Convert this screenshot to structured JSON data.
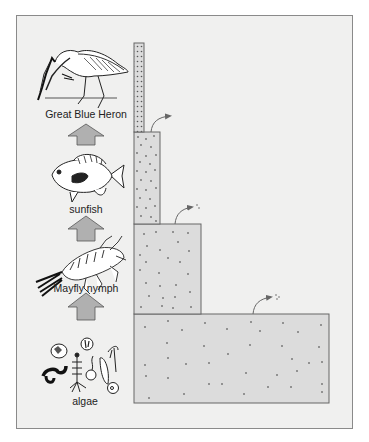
{
  "diagram": {
    "type": "energy pyramid / food chain",
    "organisms": [
      {
        "level": 4,
        "name": "Great Blue Heron",
        "icon": "heron-icon"
      },
      {
        "level": 3,
        "name": "sunfish",
        "icon": "fish-icon"
      },
      {
        "level": 2,
        "name": "Mayfly nymph",
        "icon": "mayfly-nymph-icon"
      },
      {
        "level": 1,
        "name": "algae",
        "icon": "algae-icon"
      }
    ],
    "arrows": [
      "up-arrow",
      "up-arrow",
      "up-arrow"
    ],
    "colors": {
      "background": "#f0f0ef",
      "bar_fill": "#dcdcdc",
      "bar_border": "#666666",
      "arrow_fill": "#b0b0b0",
      "dot": "#7a7a7a"
    }
  }
}
